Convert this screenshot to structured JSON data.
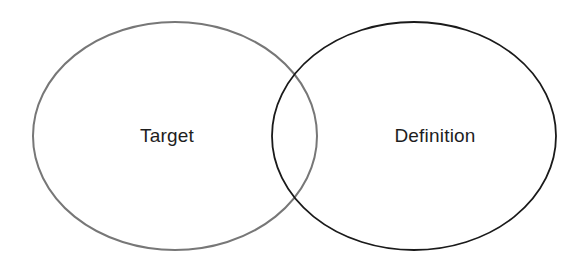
{
  "diagram": {
    "type": "venn",
    "sets": [
      {
        "name": "Target",
        "label": "Target",
        "stroke": "#777777",
        "cx": 175,
        "cy": 136,
        "rx": 142,
        "ry": 114
      },
      {
        "name": "Definition",
        "label": "Definition",
        "stroke": "#1a1a1a",
        "cx": 414,
        "cy": 136,
        "rx": 142,
        "ry": 114
      }
    ],
    "background": "#ffffff"
  }
}
